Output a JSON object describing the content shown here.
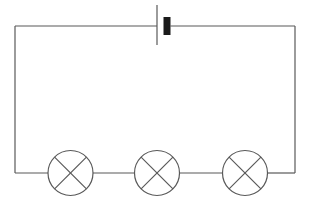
{
  "diagram": {
    "type": "electrical-circuit-schematic",
    "canvas": {
      "width": 310,
      "height": 205,
      "background_color": "#ffffff"
    },
    "style": {
      "wire_color": "#595959",
      "wire_width": 1.2,
      "lamp_stroke_color": "#595959",
      "lamp_stroke_width": 1.2,
      "lamp_fill_color": "#ffffff",
      "battery_line_color": "#595959",
      "battery_bar_color": "#1a1a1a"
    },
    "loop": {
      "label": "circuit-loop",
      "left_x": 15,
      "right_x": 295,
      "top_y": 26,
      "bottom_y": 173
    },
    "battery": {
      "label": "battery-cell",
      "symbol": "battery-icon",
      "negative_terminal": {
        "label": "long-thin-plate",
        "x": 157,
        "y_top": 5,
        "y_bottom": 45,
        "thickness": 1.2
      },
      "positive_terminal": {
        "label": "short-thick-plate",
        "x": 163.5,
        "y_top": 17,
        "y_bottom": 35,
        "width": 7
      },
      "wire_gap": {
        "left_end_x": 157,
        "right_start_x": 170.5
      }
    },
    "lamps": [
      {
        "label": "lamp-1",
        "symbol": "lamp-icon",
        "cx": 70.5,
        "cy": 173,
        "r": 22.5
      },
      {
        "label": "lamp-2",
        "symbol": "lamp-icon",
        "cx": 157,
        "cy": 173,
        "r": 22.5
      },
      {
        "label": "lamp-3",
        "symbol": "lamp-icon",
        "cx": 245,
        "cy": 173,
        "r": 22.5
      }
    ],
    "wire_segments": [
      {
        "label": "top-wire-left",
        "x1": 15,
        "y1": 26,
        "x2": 157,
        "y2": 26
      },
      {
        "label": "top-wire-right",
        "x1": 170.5,
        "y1": 26,
        "x2": 295,
        "y2": 26
      },
      {
        "label": "left-wire",
        "x1": 15,
        "y1": 26,
        "x2": 15,
        "y2": 173
      },
      {
        "label": "right-wire",
        "x1": 295,
        "y1": 26,
        "x2": 295,
        "y2": 173
      },
      {
        "label": "bottom-wire-a",
        "x1": 15,
        "y1": 173,
        "x2": 48,
        "y2": 173
      },
      {
        "label": "bottom-wire-b",
        "x1": 93,
        "y1": 173,
        "x2": 134.5,
        "y2": 173
      },
      {
        "label": "bottom-wire-c",
        "x1": 179.5,
        "y1": 173,
        "x2": 222.5,
        "y2": 173
      },
      {
        "label": "bottom-wire-d",
        "x1": 267.5,
        "y1": 173,
        "x2": 295,
        "y2": 173
      }
    ]
  }
}
